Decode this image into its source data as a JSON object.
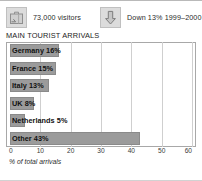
{
  "stats": [
    {
      "icon": "suitcase-icon",
      "text": "73,000 visitors"
    },
    {
      "icon": "down-arrow-icon",
      "text": "Down 13% 1999–2000"
    }
  ],
  "colors": {
    "bar_fill": "#9b9b9b",
    "bar_stroke": "#8a8a8a",
    "grid": "#cfcfcf",
    "frame": "#a8a8a8",
    "icon_fill": "#dcdcdc"
  },
  "chart_data": {
    "type": "bar",
    "orientation": "horizontal",
    "title": "MAIN TOURIST ARRIVALS",
    "xlabel": "% of total arrivals",
    "ylabel": "",
    "xlim": [
      0,
      60
    ],
    "xticks": [
      0,
      10,
      20,
      30,
      40,
      50,
      60
    ],
    "grid": true,
    "legend": "none",
    "categories": [
      "Germany",
      "France",
      "Italy",
      "UK",
      "Netherlands",
      "Other"
    ],
    "values": [
      16,
      15,
      13,
      8,
      5,
      43
    ],
    "data_labels": [
      "Germany 16%",
      "France 15%",
      "Italy 13%",
      "UK 8%",
      "Netherlands 5%",
      "Other 43%"
    ]
  }
}
